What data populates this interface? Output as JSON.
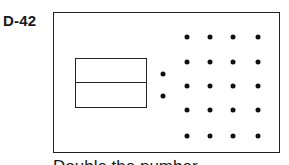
{
  "figure": {
    "label": "D-42",
    "caption": "Double the number"
  },
  "diagram": {
    "rectangle": {
      "sections": 2
    },
    "middle_dots": [
      {
        "x": 163,
        "y": 74
      },
      {
        "x": 163,
        "y": 96
      }
    ],
    "dot_grid": {
      "columns_x": [
        187,
        210,
        233,
        258
      ],
      "rows_y": [
        37,
        62,
        86,
        110,
        136
      ],
      "count": 20
    }
  }
}
